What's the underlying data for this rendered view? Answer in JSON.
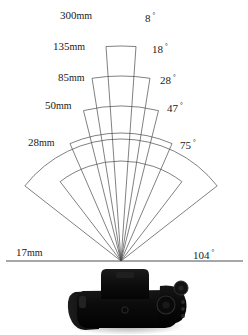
{
  "diagram": {
    "line_color": "#4a4a4a",
    "baseline_color": "#3a3a3a",
    "text_color": "#1a1a1a",
    "background": "#ffffff",
    "vertex": {
      "x": 121,
      "y": 261
    },
    "baseline": {
      "x1": 6,
      "x2": 243,
      "y": 261
    }
  },
  "chart_data": {
    "type": "fan",
    "xlabel": "",
    "ylabel": "",
    "focal_label_unit": "mm",
    "angle_label_unit": "°",
    "series": [
      {
        "focal_length": "300mm",
        "angle": "8",
        "angle_deg": 8,
        "arc_radius": 215
      },
      {
        "focal_length": "135mm",
        "angle": "18",
        "angle_deg": 18,
        "arc_radius": 185
      },
      {
        "focal_length": "85mm",
        "angle": "28",
        "angle_deg": 28,
        "arc_radius": 155
      },
      {
        "focal_length": "50mm",
        "angle": "47",
        "angle_deg": 47,
        "arc_radius": 128
      },
      {
        "focal_length": "28mm",
        "angle": "75",
        "angle_deg": 75,
        "arc_radius": 100
      },
      {
        "focal_length": "17mm",
        "angle": "104",
        "angle_deg": 104,
        "arc_radius": 122
      }
    ]
  },
  "labels": {
    "focal": [
      {
        "text": "300mm",
        "x": 60,
        "y": 10
      },
      {
        "text": "135mm",
        "x": 53,
        "y": 41
      },
      {
        "text": "85mm",
        "x": 58,
        "y": 72
      },
      {
        "text": "50mm",
        "x": 45,
        "y": 100
      },
      {
        "text": "28mm",
        "x": 28,
        "y": 137
      },
      {
        "text": "17mm",
        "x": 16,
        "y": 247
      }
    ],
    "angles": [
      {
        "text": "8",
        "x": 145,
        "y": 10
      },
      {
        "text": "18",
        "x": 152,
        "y": 41
      },
      {
        "text": "28",
        "x": 160,
        "y": 72
      },
      {
        "text": "47",
        "x": 167,
        "y": 100
      },
      {
        "text": "75",
        "x": 180,
        "y": 137
      },
      {
        "text": "104",
        "x": 193,
        "y": 247
      }
    ]
  },
  "camera": {
    "name": "dslr-camera",
    "body_color": "#101010",
    "cx": 127,
    "top": 269,
    "width": 104,
    "height": 60
  }
}
